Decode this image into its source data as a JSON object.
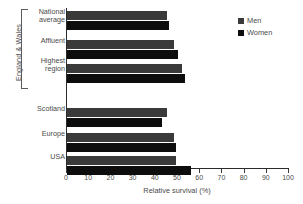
{
  "chart_data": {
    "type": "bar",
    "orientation": "horizontal",
    "title": "",
    "xlabel": "Relative survival (%)",
    "ylabel": "",
    "xlim": [
      0,
      100
    ],
    "xticks": [
      0,
      10,
      20,
      30,
      40,
      50,
      60,
      70,
      80,
      90,
      100
    ],
    "xtick_labels": [
      "0",
      "10",
      "20",
      "30",
      "40",
      "50",
      "60",
      "70",
      "80",
      "90",
      "100"
    ],
    "grid": false,
    "legend_position": "top-right",
    "categories": [
      "National average",
      "Affluent",
      "Highest region",
      "Scotland",
      "Europe",
      "USA"
    ],
    "series": [
      {
        "name": "Men",
        "color": "#3a3a3a",
        "values": [
          45,
          48,
          52,
          45,
          48,
          49
        ]
      },
      {
        "name": "Women",
        "color": "#0d0d0d",
        "values": [
          46,
          50,
          53,
          43,
          49,
          56
        ]
      }
    ],
    "group_bracket": {
      "label": "England & Wales",
      "categories": [
        "National average",
        "Affluent",
        "Highest region"
      ]
    }
  },
  "labels": {
    "group_axis": "England & Wales",
    "categories": [
      {
        "line1": "National",
        "line2": "average"
      },
      {
        "line1": "Affluent",
        "line2": ""
      },
      {
        "line1": "Highest",
        "line2": "region"
      },
      {
        "line1": "Scotland",
        "line2": ""
      },
      {
        "line1": "Europe",
        "line2": ""
      },
      {
        "line1": "USA",
        "line2": ""
      }
    ]
  },
  "legend": {
    "items": [
      {
        "label": "Men"
      },
      {
        "label": "Women"
      }
    ]
  },
  "axis": {
    "x_title": "Relative survival (%)",
    "ticks": [
      "0",
      "10",
      "20",
      "30",
      "40",
      "50",
      "60",
      "70",
      "80",
      "90",
      "100"
    ]
  }
}
